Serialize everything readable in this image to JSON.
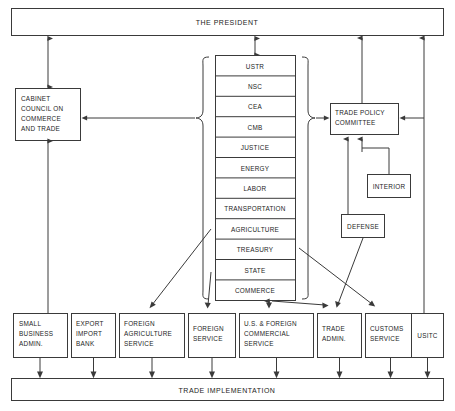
{
  "diagram": {
    "title": "THE PRESIDENT",
    "top_bar": {
      "label": "THE PRESIDENT"
    },
    "bottom_bar": {
      "label": "TRADE IMPLEMENTATION"
    },
    "cabinet_council": {
      "line1": "CABINET",
      "line2": "COUNCIL ON",
      "line3": "COMMERCE",
      "line4": "AND TRADE"
    },
    "trade_policy_committee": {
      "line1": "TRADE POLICY",
      "line2": "COMMITTEE"
    },
    "interior": {
      "label": "INTERIOR"
    },
    "defense": {
      "label": "DEFENSE"
    },
    "agency_stack": {
      "items": [
        {
          "label": "USTR"
        },
        {
          "label": "NSC"
        },
        {
          "label": "CEA"
        },
        {
          "label": "CMB"
        },
        {
          "label": "JUSTICE"
        },
        {
          "label": "ENERGY"
        },
        {
          "label": "LABOR"
        },
        {
          "label": "TRANSPORTATION"
        },
        {
          "label": "AGRICULTURE"
        },
        {
          "label": "TREASURY"
        },
        {
          "label": "STATE"
        },
        {
          "label": "COMMERCE"
        }
      ]
    },
    "implementing_agencies": [
      {
        "line1": "SMALL",
        "line2": "BUSINESS",
        "line3": "ADMIN."
      },
      {
        "line1": "EXPORT",
        "line2": "IMPORT",
        "line3": "BANK"
      },
      {
        "line1": "FOREIGN",
        "line2": "AGRICULTURE",
        "line3": "SERVICE"
      },
      {
        "line1": "FOREIGN",
        "line2": "SERVICE",
        "line3": ""
      },
      {
        "line1": "U.S. & FOREIGN",
        "line2": "COMMERCIAL",
        "line3": "SERVICE"
      },
      {
        "line1": "TRADE",
        "line2": "ADMIN.",
        "line3": ""
      },
      {
        "line1": "CUSTOMS",
        "line2": "SERVICE",
        "line3": ""
      },
      {
        "line1": "USITC",
        "line2": "",
        "line3": ""
      }
    ],
    "colors": {
      "line": "#3a3a3a",
      "text": "#1d1d1d",
      "background": "#ffffff"
    }
  }
}
